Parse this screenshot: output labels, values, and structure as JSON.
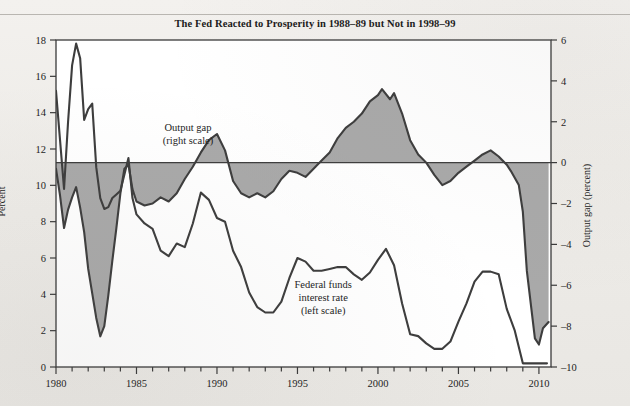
{
  "chart_data": {
    "type": "line",
    "title": "The Fed Reacted to Prosperity in 1988–89 but Not in 1998–99",
    "xlabel": "",
    "ylabel": "Percent",
    "y2label": "Output gap (percent)",
    "xlim": [
      1980,
      2010.75
    ],
    "ylim": [
      0,
      18
    ],
    "y2lim": [
      -10,
      6
    ],
    "grid": false,
    "legend_position": "inline-annotations",
    "x_major_ticks": [
      1980,
      1985,
      1990,
      1995,
      2000,
      2005,
      2010
    ],
    "x_major_tick_labels": [
      "1980",
      "1985",
      "1990",
      "1995",
      "2000",
      "2005",
      "2010"
    ],
    "x_minor_tick_step": 1,
    "y_ticks": [
      0,
      2,
      4,
      6,
      8,
      10,
      12,
      14,
      16,
      18
    ],
    "y_tick_labels": [
      "0",
      "2",
      "4",
      "6",
      "8",
      "10",
      "12",
      "14",
      "16",
      "18"
    ],
    "y2_ticks": [
      -10,
      -8,
      -6,
      -4,
      -2,
      0,
      2,
      4,
      6
    ],
    "y2_tick_labels": [
      "–10",
      "–8",
      "–6",
      "–4",
      "–2",
      "0",
      "2",
      "4",
      "6"
    ],
    "zero_reference_line": 0,
    "annotations": [
      {
        "name": "output-gap-annotation",
        "text_lines": [
          "Output gap",
          "(right scale)"
        ],
        "x": 1988.2,
        "y2": 1.55
      },
      {
        "name": "fed-funds-annotation",
        "text_lines": [
          "Federal funds",
          "interest rate",
          "(left scale)"
        ],
        "x": 1996.6,
        "y": 4.35
      }
    ],
    "colors": {
      "line": "#3d3d3d",
      "fill": "#a9a9a9",
      "axis": "#3a3a3a",
      "text": "#1c1c1c",
      "background": "#ffffff",
      "page_background": "#efedea"
    },
    "series": [
      {
        "name": "Federal funds interest rate",
        "axis": "left",
        "style": "line",
        "x": [
          1980.0,
          1980.25,
          1980.5,
          1980.75,
          1981.0,
          1981.25,
          1981.5,
          1981.75,
          1982.0,
          1982.25,
          1982.5,
          1982.75,
          1983.0,
          1983.25,
          1983.5,
          1983.75,
          1984.0,
          1984.25,
          1984.5,
          1984.75,
          1985.0,
          1985.5,
          1986.0,
          1986.5,
          1987.0,
          1987.5,
          1988.0,
          1988.5,
          1989.0,
          1989.5,
          1990.0,
          1990.5,
          1991.0,
          1991.5,
          1992.0,
          1992.5,
          1993.0,
          1993.5,
          1994.0,
          1994.5,
          1995.0,
          1995.5,
          1996.0,
          1996.5,
          1997.0,
          1997.5,
          1998.0,
          1998.5,
          1999.0,
          1999.5,
          2000.0,
          2000.5,
          2001.0,
          2001.5,
          2002.0,
          2002.5,
          2003.0,
          2003.5,
          2004.0,
          2004.5,
          2005.0,
          2005.5,
          2006.0,
          2006.5,
          2007.0,
          2007.5,
          2008.0,
          2008.5,
          2009.0,
          2009.5,
          2010.0,
          2010.5
        ],
        "y": [
          15.2,
          12.5,
          9.8,
          13.5,
          16.6,
          17.8,
          17.0,
          13.6,
          14.2,
          14.5,
          11.0,
          9.3,
          8.7,
          8.8,
          9.3,
          9.5,
          9.7,
          10.6,
          11.5,
          9.3,
          8.4,
          7.9,
          7.6,
          6.4,
          6.1,
          6.8,
          6.6,
          7.9,
          9.6,
          9.2,
          8.2,
          8.0,
          6.4,
          5.5,
          4.1,
          3.3,
          3.0,
          3.0,
          3.6,
          4.9,
          6.0,
          5.8,
          5.3,
          5.3,
          5.4,
          5.5,
          5.5,
          5.1,
          4.8,
          5.2,
          5.9,
          6.5,
          5.6,
          3.5,
          1.8,
          1.7,
          1.3,
          1.0,
          1.0,
          1.4,
          2.5,
          3.5,
          4.7,
          5.25,
          5.25,
          5.1,
          3.2,
          2.0,
          0.2,
          0.2,
          0.2,
          0.2
        ]
      },
      {
        "name": "Output gap",
        "axis": "right",
        "style": "filled-to-zero",
        "x": [
          1980.0,
          1980.25,
          1980.5,
          1980.75,
          1981.0,
          1981.25,
          1981.5,
          1981.75,
          1982.0,
          1982.25,
          1982.5,
          1982.75,
          1983.0,
          1983.25,
          1983.5,
          1983.75,
          1984.0,
          1984.25,
          1984.5,
          1984.75,
          1985.0,
          1985.5,
          1986.0,
          1986.5,
          1987.0,
          1987.5,
          1988.0,
          1988.5,
          1989.0,
          1989.5,
          1990.0,
          1990.5,
          1991.0,
          1991.5,
          1992.0,
          1992.5,
          1993.0,
          1993.5,
          1994.0,
          1994.5,
          1995.0,
          1995.5,
          1996.0,
          1996.5,
          1997.0,
          1997.5,
          1998.0,
          1998.5,
          1999.0,
          1999.5,
          2000.0,
          2000.25,
          2000.75,
          2001.0,
          2001.5,
          2002.0,
          2002.5,
          2003.0,
          2003.5,
          2004.0,
          2004.5,
          2005.0,
          2005.5,
          2006.0,
          2006.5,
          2007.0,
          2007.5,
          2008.0,
          2008.25,
          2008.75,
          2009.0,
          2009.25,
          2009.75,
          2010.0,
          2010.25,
          2010.6
        ],
        "y": [
          -0.3,
          -1.6,
          -3.2,
          -2.3,
          -1.7,
          -1.2,
          -2.2,
          -3.4,
          -5.2,
          -6.4,
          -7.6,
          -8.5,
          -8.0,
          -6.5,
          -4.8,
          -3.2,
          -1.5,
          -0.3,
          -0.1,
          -1.3,
          -1.9,
          -2.1,
          -2.0,
          -1.7,
          -1.9,
          -1.5,
          -0.8,
          -0.2,
          0.5,
          1.1,
          1.4,
          0.6,
          -0.9,
          -1.5,
          -1.7,
          -1.5,
          -1.7,
          -1.4,
          -0.8,
          -0.4,
          -0.5,
          -0.7,
          -0.3,
          0.1,
          0.5,
          1.2,
          1.7,
          2.0,
          2.4,
          3.0,
          3.3,
          3.6,
          3.1,
          3.4,
          2.4,
          1.1,
          0.4,
          0.0,
          -0.6,
          -1.1,
          -0.9,
          -0.5,
          -0.2,
          0.1,
          0.4,
          0.6,
          0.3,
          -0.1,
          -0.4,
          -1.1,
          -2.4,
          -5.3,
          -8.6,
          -8.9,
          -8.1,
          -7.8
        ]
      }
    ]
  },
  "axis_labels": {
    "left": "Percent",
    "right": "Output gap (percent)"
  }
}
